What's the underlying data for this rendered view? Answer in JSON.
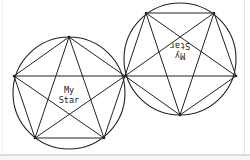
{
  "diagram": {
    "stroke_color": "#222222",
    "background": "#ffffff",
    "stars": [
      {
        "name": "left-star",
        "label_line1": "My",
        "label_line2": "Star",
        "rotation_deg": 0,
        "circle": {
          "cx": 69,
          "cy": 93,
          "r": 56
        },
        "vertices": [
          [
            69,
            37
          ],
          [
            125,
            76
          ],
          [
            104,
            138
          ],
          [
            35,
            138
          ],
          [
            14,
            76
          ]
        ]
      },
      {
        "name": "right-star",
        "label_line1": "My",
        "label_line2": "Star",
        "rotation_deg": 180,
        "circle": {
          "cx": 180,
          "cy": 59,
          "r": 56
        },
        "vertices": [
          [
            180,
            115
          ],
          [
            125,
            76
          ],
          [
            146,
            13
          ],
          [
            214,
            13
          ],
          [
            236,
            76
          ]
        ]
      }
    ]
  }
}
